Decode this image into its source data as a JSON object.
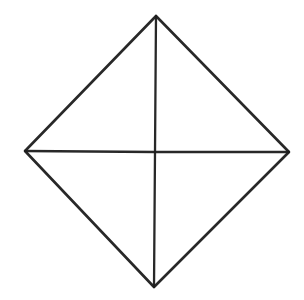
{
  "figure": {
    "canvas": {
      "width": 304,
      "height": 300,
      "background_color": "#ffffff"
    },
    "style": {
      "stroke_color": "#1c1c1c",
      "outline_stroke_width": 2.6,
      "diagonal_stroke_width": 2.3,
      "stroke_opacity": 0.95,
      "appearance": "hand-drawn ink on white paper, slightly rough edges"
    },
    "vertices": [
      {
        "name": "top",
        "label": "top-vertex",
        "x": 156,
        "y": 16
      },
      {
        "name": "right",
        "label": "right-vertex",
        "x": 289,
        "y": 152
      },
      {
        "name": "bottom",
        "label": "bottom-vertex",
        "x": 154,
        "y": 287
      },
      {
        "name": "left",
        "label": "left-vertex",
        "x": 25,
        "y": 151
      }
    ],
    "center": {
      "name": "center",
      "label": "diagonal-intersection",
      "x": 155,
      "y": 152
    },
    "outline_path": "M 156,16 L 289,152 L 154,287 L 25,151 Z",
    "diagonals": [
      {
        "name": "vertical-diagonal",
        "from": "top",
        "to": "bottom",
        "path": "M 156,16 L 155,152 L 154,287"
      },
      {
        "name": "horizontal-diagonal",
        "from": "left",
        "to": "right",
        "path": "M 25,151 L 155,152 L 289,152"
      }
    ],
    "edges": [
      {
        "name": "upper-left-edge",
        "from": "left",
        "to": "top"
      },
      {
        "name": "upper-right-edge",
        "from": "top",
        "to": "right"
      },
      {
        "name": "lower-right-edge",
        "from": "right",
        "to": "bottom"
      },
      {
        "name": "lower-left-edge",
        "from": "bottom",
        "to": "left"
      }
    ],
    "regions": [
      {
        "name": "top-left-triangle",
        "path": "M 25,151 L 156,16 L 155,152 Z"
      },
      {
        "name": "top-right-triangle",
        "path": "M 156,16 L 289,152 L 155,152 Z"
      },
      {
        "name": "bottom-right-triangle",
        "path": "M 155,152 L 289,152 L 154,287 Z"
      },
      {
        "name": "bottom-left-triangle",
        "path": "M 25,151 L 155,152 L 154,287 Z"
      }
    ],
    "labels": []
  }
}
